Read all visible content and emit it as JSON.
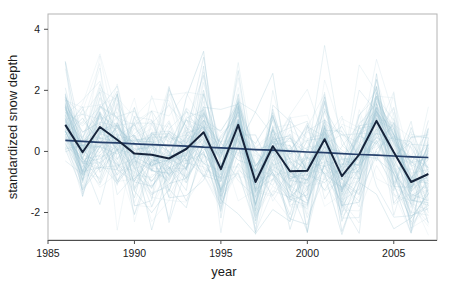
{
  "chart_data": {
    "type": "line",
    "title": "",
    "xlabel": "year",
    "ylabel": "standardized snow depth",
    "xlim": [
      1985,
      2007.5
    ],
    "ylim": [
      -2.9,
      4.5
    ],
    "xticks": [
      1985,
      1990,
      1995,
      2000,
      2005
    ],
    "xticklabels": [
      "1985",
      "1990",
      "1995",
      "2000",
      "2005"
    ],
    "yticks": [
      -2,
      0,
      2,
      4
    ],
    "yticklabels": [
      "-2",
      "0",
      "2",
      "4"
    ],
    "grid": false,
    "legend": null,
    "colors": {
      "spaghetti": "#9dc3d2",
      "mean_line": "#16243b",
      "trend_line": "#26406b",
      "panel_border": "#b4b4b4",
      "axis": "#4d4d4d",
      "text": "#1a1a1a",
      "background": "#ffffff"
    },
    "x": [
      1986,
      1987,
      1988,
      1989,
      1990,
      1991,
      1992,
      1993,
      1994,
      1995,
      1996,
      1997,
      1998,
      1999,
      2000,
      2001,
      2002,
      2003,
      2004,
      2005,
      2006,
      2007
    ],
    "series": [
      {
        "name": "mean standardized snow depth",
        "style": "thick-dark",
        "values": [
          0.87,
          -0.03,
          0.8,
          0.38,
          -0.07,
          -0.11,
          -0.23,
          0.08,
          0.63,
          -0.58,
          0.87,
          -1.0,
          0.17,
          -0.65,
          -0.63,
          0.4,
          -0.81,
          -0.1,
          1.0,
          -0.03,
          -1.0,
          -0.74
        ]
      },
      {
        "name": "linear trend",
        "style": "thin-dark-straight",
        "values": [
          0.36,
          0.33,
          0.3,
          0.28,
          0.25,
          0.22,
          0.2,
          0.17,
          0.14,
          0.12,
          0.09,
          0.06,
          0.04,
          0.01,
          -0.02,
          -0.04,
          -0.07,
          -0.1,
          -0.12,
          -0.15,
          -0.18,
          -0.2
        ]
      }
    ],
    "n_background_stations": 90,
    "background_description": "Light blue translucent spaghetti lines, one per station, standardized snow depth per year 1986-2007"
  },
  "axes": {
    "y_title": "standardized snow depth",
    "x_title": "year"
  }
}
